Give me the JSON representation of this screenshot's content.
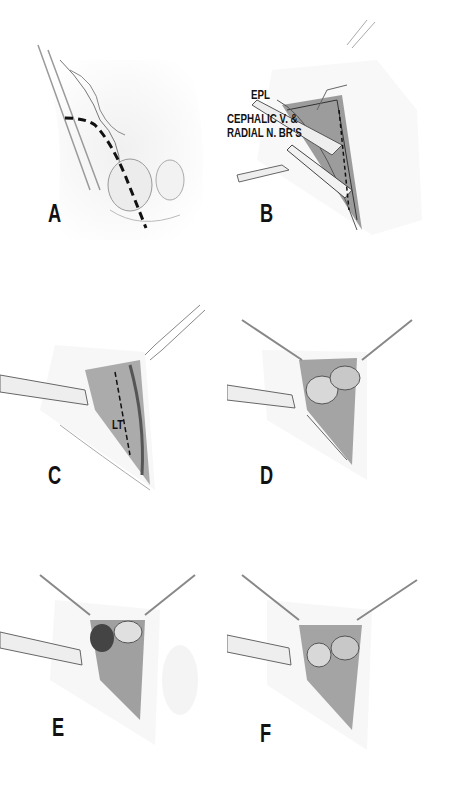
{
  "figure": {
    "panels": [
      {
        "id": "A",
        "letter": "A",
        "description": "Skin incision (dashed line) over dorsoradial wrist"
      },
      {
        "id": "B",
        "letter": "B",
        "description": "Retraction of EPL and cephalic vein & radial nerve branches",
        "labels": [
          "EPL",
          "CEPHALIC V. &",
          "RADIAL N. BR'S"
        ]
      },
      {
        "id": "C",
        "letter": "C",
        "description": "Capsular incision with dashed line",
        "labels": [
          "LT"
        ]
      },
      {
        "id": "D",
        "letter": "D",
        "description": "Capsule opened exposing carpal bones"
      },
      {
        "id": "E",
        "letter": "E",
        "description": "Exposure of bone with decorticated surface"
      },
      {
        "id": "F",
        "letter": "F",
        "description": "Final bony exposure with retracted flaps"
      }
    ],
    "labels": {
      "epl": "EPL",
      "cephalic_line1": "CEPHALIC V. &",
      "cephalic_line2": "RADIAL N. BR'S",
      "lt": "LT"
    },
    "colors": {
      "ink": "#111111",
      "shade": "#8a8a8a",
      "background": "#ffffff"
    }
  }
}
